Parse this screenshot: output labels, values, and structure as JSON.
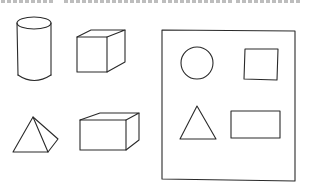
{
  "figure": {
    "stroke_color": "#2a2a2a",
    "background": "#ffffff",
    "clipped_text_segments": [
      [
        1,
        50
      ],
      [
        64,
        156
      ],
      [
        162,
        230
      ],
      [
        236,
        300
      ]
    ],
    "solids": [
      {
        "name": "cylinder"
      },
      {
        "name": "cube"
      },
      {
        "name": "pyramid"
      },
      {
        "name": "rectangular-prism"
      }
    ],
    "frame_shapes": [
      {
        "name": "circle"
      },
      {
        "name": "square"
      },
      {
        "name": "triangle"
      },
      {
        "name": "rectangle"
      }
    ]
  }
}
